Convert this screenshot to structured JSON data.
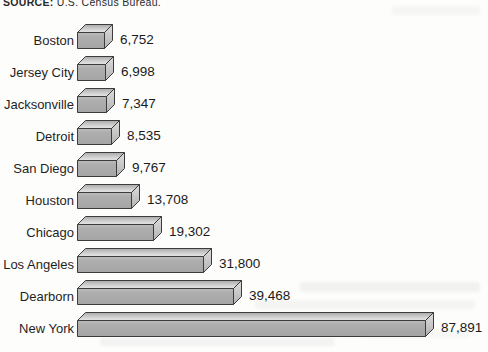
{
  "source_note": {
    "prefix": "SOURCE:",
    "text": "U.S. Census Bureau."
  },
  "colors": {
    "background": "#fdfdfc",
    "bar_front": "#ababab",
    "bar_top_light": "#e6e6e6",
    "bar_top_dark": "#a9a9a9",
    "bar_end_light": "#dedede",
    "bar_end_dark": "#b2b2b2",
    "bar_outline": "#3c3c3c",
    "text": "#1f1f1f"
  },
  "chart_data": {
    "type": "bar",
    "orientation": "horizontal",
    "style": "3d-box",
    "title": "",
    "xlabel": "",
    "ylabel": "",
    "xlim": [
      0,
      87891
    ],
    "grid": false,
    "legend": false,
    "categories": [
      "Boston",
      "Jersey City",
      "Jacksonville",
      "Detroit",
      "San Diego",
      "Houston",
      "Chicago",
      "Los Angeles",
      "Dearborn",
      "New York"
    ],
    "values": [
      6752,
      6998,
      7347,
      8535,
      9767,
      13708,
      19302,
      31800,
      39468,
      87891
    ],
    "value_labels": [
      "6,752",
      "6,998",
      "7,347",
      "8,535",
      "9,767",
      "13,708",
      "19,302",
      "31,800",
      "39,468",
      "87,891"
    ]
  }
}
